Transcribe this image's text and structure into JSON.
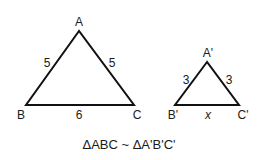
{
  "diagram": {
    "triangle_abc": {
      "vertices": {
        "A": "A",
        "B": "B",
        "C": "C"
      },
      "sides": {
        "AB": "5",
        "AC": "5",
        "BC": "6"
      }
    },
    "triangle_a1b1c1": {
      "vertices": {
        "A": "A'",
        "B": "B'",
        "C": "C'"
      },
      "sides": {
        "AB": "3",
        "AC": "3",
        "BC": "x"
      }
    },
    "caption": "ΔABC ~ ΔA'B'C'"
  }
}
